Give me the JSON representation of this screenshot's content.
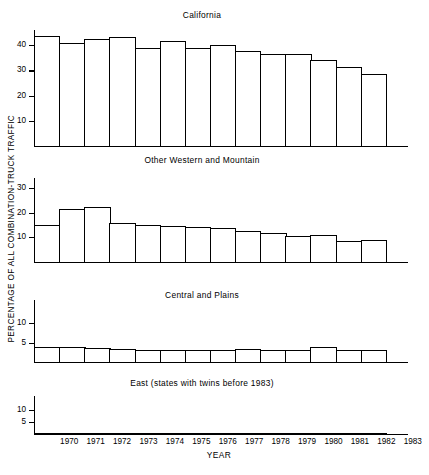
{
  "figure": {
    "ylabel": "PERCENTAGE OF ALL COMBINATION-TRUCK TRAFFIC",
    "xlabel": "YEAR"
  },
  "chart_data": {
    "type": "bar",
    "title": "",
    "xlabel": "YEAR",
    "ylabel": "PERCENTAGE OF ALL COMBINATION-TRUCK TRAFFIC",
    "grid": false,
    "legend": "none",
    "categories": [
      "1970",
      "1971",
      "1972",
      "1973",
      "1974",
      "1975",
      "1976",
      "1977",
      "1978",
      "1979",
      "1980",
      "1981",
      "1982",
      "1983"
    ],
    "panels": [
      {
        "title": "California",
        "ylim": [
          0,
          46
        ],
        "yticks": [
          10,
          20,
          30,
          40
        ],
        "ytick_labels": [
          "10",
          "20",
          "30",
          "40"
        ],
        "values": [
          43.5,
          40.7,
          42.5,
          43.2,
          38.8,
          41.5,
          38.8,
          40.0,
          37.5,
          36.5,
          36.4,
          34.3,
          31.3,
          28.5
        ]
      },
      {
        "title": "Other Western and Mountain",
        "ylim": [
          0,
          34
        ],
        "yticks": [
          10,
          20,
          30
        ],
        "ytick_labels": [
          "10",
          "20",
          "30"
        ],
        "values": [
          15.0,
          21.3,
          22.1,
          15.6,
          15.1,
          14.6,
          14.0,
          13.9,
          12.4,
          11.8,
          10.4,
          10.9,
          8.5,
          8.9
        ]
      },
      {
        "title": "Central and Plains",
        "ylim": [
          0,
          16
        ],
        "yticks": [
          5,
          10
        ],
        "ytick_labels": [
          "5",
          "10"
        ],
        "values": [
          3.9,
          3.8,
          3.6,
          3.4,
          3.2,
          3.2,
          3.1,
          3.0,
          3.4,
          3.0,
          3.1,
          3.8,
          3.2,
          3.1
        ]
      },
      {
        "title": "East (states with twins before 1983)",
        "ylim": [
          0,
          16
        ],
        "yticks": [
          5,
          10
        ],
        "ytick_labels": [
          "5",
          "10"
        ],
        "values": [
          0.3,
          0.3,
          0.4,
          0.3,
          0.4,
          0.5,
          0.5,
          0.3,
          0.2,
          0.1,
          0.1,
          0.1,
          0.35,
          0.25
        ]
      }
    ]
  }
}
